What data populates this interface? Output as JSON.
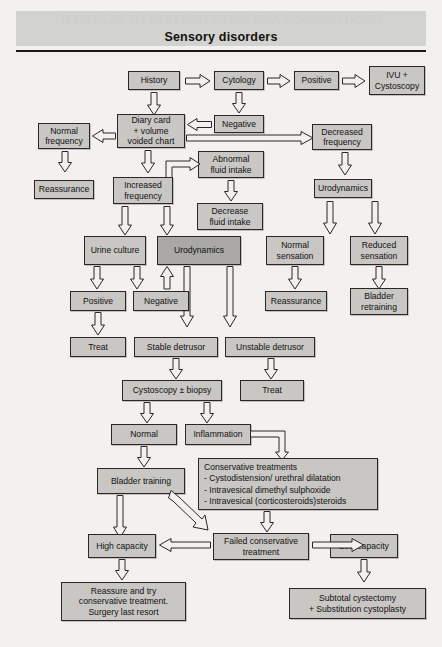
{
  "page": {
    "title": "Sensory disorders",
    "ghost_header": "URODYNAMICS AND INVESTIGATION OF BLADDER",
    "background_color": "#f2f1ef",
    "box_fill": "#c8c7c4",
    "box_fill_highlight": "#a9a8a4",
    "box_border": "#2a2825",
    "rule_color": "#1b1917"
  },
  "nodes": {
    "history": "History",
    "cytology": "Cytology",
    "positive_cytology": "Positive",
    "ivu_cystoscopy": "IVU +\nCystoscopy",
    "negative_cytology": "Negative",
    "diary_card": "Diary card\n+ volume\nvoided chart",
    "normal_frequency": "Normal\nfrequency",
    "decreased_frequency": "Decreased\nfrequency",
    "abnormal_fluid_intake": "Abnormal\nfluid intake",
    "reassurance_left": "Reassurance",
    "increased_frequency": "Increased\nfrequency",
    "decrease_fluid_intake": "Decrease\nfluid intake",
    "urodynamics_right": "Urodynamics",
    "urine_culture": "Urine culture",
    "urodynamics_center": "Urodynamics",
    "normal_sensation": "Normal\nsensation",
    "reduced_sensation": "Reduced\nsensation",
    "culture_positive": "Positive",
    "culture_negative": "Negative",
    "reassurance_sensation": "Reassurance",
    "bladder_retraining": "Bladder\nretraining",
    "treat_culture": "Treat",
    "stable_detrusor": "Stable detrusor",
    "unstable_detrusor": "Unstable detrusor",
    "cystoscopy_biopsy": "Cystoscopy ± biopsy",
    "treat_unstable": "Treat",
    "normal_biopsy": "Normal",
    "inflammation": "Inflammation",
    "bladder_training": "Bladder training",
    "conservative_heading": "Conservative treatments",
    "conservative_item_1": "- Cystodistension/ urethral dilatation",
    "conservative_item_2": "- Intravesical dimethyl sulphoxide",
    "conservative_item_3": "- Intravesical (corticosteroids)steroids",
    "high_capacity": "High capacity",
    "failed_conservative": "Failed conservative\ntreatment",
    "low_capacity": "Low capacity",
    "reassure_surgery": "Reassure and try\nconservative treatment.\nSurgery last resort",
    "subtotal_cystectomy": "Subtotal cystectomy\n+ Substitution cystoplasty"
  }
}
